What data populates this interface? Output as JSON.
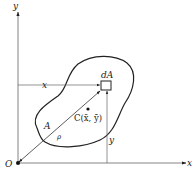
{
  "diagram": {
    "axes": {
      "x_label": "x",
      "y_label": "y",
      "origin_label": "O"
    },
    "region": {
      "area_label": "A",
      "element_label": "dA",
      "centroid_label": "C(x̄, ȳ)",
      "radius_label": "ρ"
    },
    "dimensions": {
      "horizontal_label": "x",
      "vertical_label": "y"
    },
    "caption": ""
  }
}
